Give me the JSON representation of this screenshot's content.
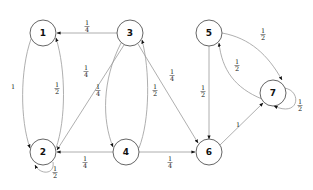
{
  "diagram": {
    "type": "markov-chain-state-transition-graph",
    "colors": {
      "edge": "#9a9a9a",
      "node_stroke": "#555555",
      "text": "#111111",
      "background": "#ffffff"
    },
    "nodes": [
      {
        "id": "1",
        "label": "1"
      },
      {
        "id": "2",
        "label": "2"
      },
      {
        "id": "3",
        "label": "3"
      },
      {
        "id": "4",
        "label": "4"
      },
      {
        "id": "5",
        "label": "5"
      },
      {
        "id": "6",
        "label": "6"
      },
      {
        "id": "7",
        "label": "7"
      }
    ],
    "edges": [
      {
        "from": "3",
        "to": "1",
        "label": "1/4",
        "num": "1",
        "den": "4"
      },
      {
        "from": "1",
        "to": "2",
        "label": "1",
        "num": "1",
        "den": ""
      },
      {
        "from": "2",
        "to": "1",
        "label": "1/2",
        "num": "1",
        "den": "2"
      },
      {
        "from": "3",
        "to": "2",
        "label": "1/4",
        "num": "1",
        "den": "4"
      },
      {
        "from": "3",
        "to": "4",
        "label": "1/4",
        "num": "1",
        "den": "4"
      },
      {
        "from": "4",
        "to": "3",
        "label": "1/2",
        "num": "1",
        "den": "2"
      },
      {
        "from": "3",
        "to": "6",
        "label": "1/4",
        "num": "1",
        "den": "4"
      },
      {
        "from": "2",
        "to": "2",
        "label": "1/2",
        "num": "1",
        "den": "2"
      },
      {
        "from": "4",
        "to": "2",
        "label": "1/4",
        "num": "1",
        "den": "4"
      },
      {
        "from": "4",
        "to": "6",
        "label": "1/4",
        "num": "1",
        "den": "4"
      },
      {
        "from": "5",
        "to": "6",
        "label": "1/2",
        "num": "1",
        "den": "2"
      },
      {
        "from": "5",
        "to": "7",
        "label": "1/2",
        "num": "1",
        "den": "2"
      },
      {
        "from": "7",
        "to": "5",
        "label": "1/2",
        "num": "1",
        "den": "2"
      },
      {
        "from": "6",
        "to": "7",
        "label": "1",
        "num": "1",
        "den": ""
      },
      {
        "from": "7",
        "to": "7",
        "label": "1/2",
        "num": "1",
        "den": "2"
      }
    ]
  }
}
